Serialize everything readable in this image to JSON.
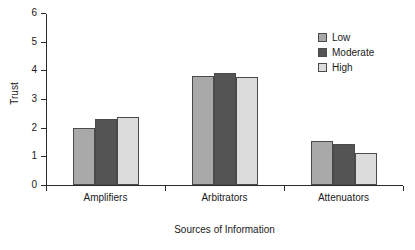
{
  "chart_data": {
    "type": "bar",
    "title": "",
    "xlabel": "Sources of Information",
    "ylabel": "Trust",
    "categories": [
      "Amplifiers",
      "Arbitrators",
      "Attenuators"
    ],
    "series": [
      {
        "name": "Low",
        "values": [
          2.0,
          3.8,
          1.53
        ],
        "color": "#a9a9a9"
      },
      {
        "name": "Moderate",
        "values": [
          2.32,
          3.9,
          1.42
        ],
        "color": "#545454"
      },
      {
        "name": "High",
        "values": [
          2.38,
          3.78,
          1.12
        ],
        "color": "#dcdcdc"
      }
    ],
    "ylim": [
      0,
      6
    ],
    "yticks": [
      "0",
      "1",
      "2",
      "3",
      "4",
      "5",
      "6"
    ],
    "grid": false,
    "legend_position": "top-right",
    "legend_entries": [
      "Low",
      "Moderate",
      "High"
    ]
  },
  "axis": {
    "line_color": "#2b2b2b",
    "bar_outline_color": "#4a4a4a"
  }
}
